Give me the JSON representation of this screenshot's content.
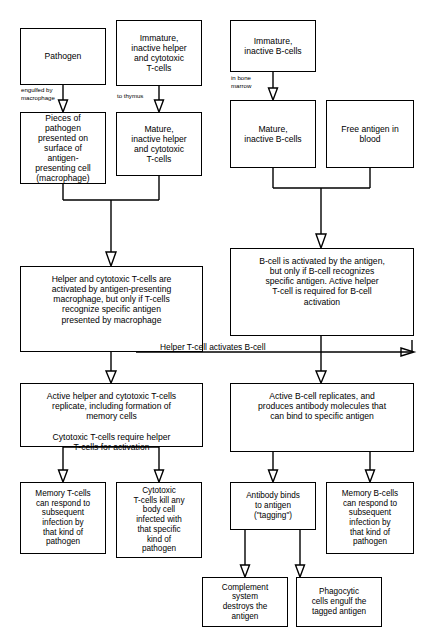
{
  "diagram": {
    "line_color": "#000000",
    "background_color": "#ffffff",
    "nodes": [
      {
        "id": "pathogen",
        "label": "Pathogen"
      },
      {
        "id": "immature-t-cells",
        "label": "Immature,\ninactive helper\nand cytotoxic\nT-cells"
      },
      {
        "id": "immature-b-cells",
        "label": "Immature,\ninactive B-cells"
      },
      {
        "id": "antigen-presenting-cell",
        "label": "Pieces of\npathogen\npresented on\nsurface of\nantigen-\npresenting cell\n(macrophage)"
      },
      {
        "id": "mature-t-cells",
        "label": "Mature,\ninactive helper\nand cytotoxic\nT-cells"
      },
      {
        "id": "mature-b-cells",
        "label": "Mature,\ninactive B-cells"
      },
      {
        "id": "free-antigen",
        "label": "Free antigen in\nblood"
      },
      {
        "id": "t-cell-activation",
        "label": "Helper and cytotoxic T-cells are\nactivated by antigen-presenting\nmacrophage, but only if T-cells\nrecognize specific antigen\npresented by macrophage"
      },
      {
        "id": "b-cell-activation",
        "label": "B-cell is activated by the antigen,\nbut only if B-cell recognizes\nspecific antigen. Active helper\nT-cell is required for B-cell\nactivation"
      },
      {
        "id": "t-cell-replication",
        "label": "Active helper and cytotoxic T-cells\nreplicate, including formation of\nmemory cells\n\nCytotoxic T-cells require helper\nT-cells for activation"
      },
      {
        "id": "b-cell-replication",
        "label": "Active B-cell replicates, and\nproduces antibody molecules that\ncan bind to specific antigen"
      },
      {
        "id": "memory-t-cells",
        "label": "Memory T-cells\ncan respond to\nsubsequent\ninfection by\nthat kind of\npathogen"
      },
      {
        "id": "cytotoxic-t-cells-kill",
        "label": "Cytotoxic\nT-cells kill any\nbody cell\ninfected with\nthat specific\nkind of\npathogen"
      },
      {
        "id": "antibody-binds",
        "label": "Antibody binds\nto antigen\n(\"tagging\")"
      },
      {
        "id": "memory-b-cells",
        "label": "Memory B-cells\ncan respond to\nsubsequent\ninfection by\nthat kind of\npathogen"
      },
      {
        "id": "complement-system",
        "label": "Complement\nsystem\ndestroys the\nantigen"
      },
      {
        "id": "phagocytic-cells",
        "label": "Phagocytic\ncells engulf the\ntagged antigen"
      }
    ],
    "edge_labels": [
      {
        "id": "engulfed-by-macrophage",
        "text": "engulfed by\nmacrophage"
      },
      {
        "id": "to-thymus",
        "text": "to thymus"
      },
      {
        "id": "in-bone-marrow",
        "text": "in bone\nmarrow"
      }
    ],
    "link_labels": [
      {
        "id": "helper-t-cell-activates-b-cell",
        "text": "Helper T-cell activates B-cell"
      }
    ]
  }
}
